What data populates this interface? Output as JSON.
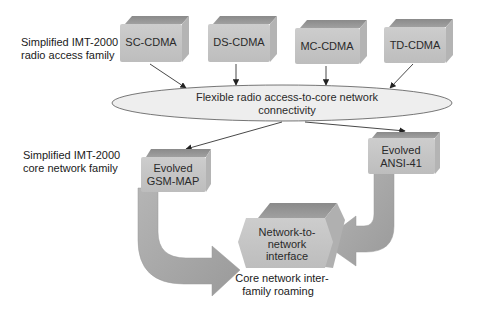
{
  "side_labels": {
    "radio_access": [
      "Simplified IMT-2000",
      "radio access family"
    ],
    "core_network": [
      "Simplified IMT-2000",
      "core network family"
    ]
  },
  "radio_boxes": [
    {
      "label": "SC-CDMA"
    },
    {
      "label": "DS-CDMA"
    },
    {
      "label": "MC-CDMA"
    },
    {
      "label": "TD-CDMA"
    }
  ],
  "connectivity_ellipse": {
    "lines": [
      "Flexible radio access-to-core network",
      "connectivity"
    ]
  },
  "core_boxes": {
    "gsm_map": [
      "Evolved",
      "GSM-MAP"
    ],
    "ansi_41": [
      "Evolved",
      "ANSI-41"
    ]
  },
  "nni_box": [
    "Network-to-",
    "network",
    "interface"
  ],
  "roaming_caption": [
    "Core network inter-",
    "family roaming"
  ],
  "colors": {
    "box_face": "#c4c4c4",
    "box_top": "#8f8f8f",
    "box_side": "#b2b2b2",
    "ellipse_fill": "#ececec",
    "arrow_fill": "#a9a9a9",
    "line": "#333333"
  }
}
